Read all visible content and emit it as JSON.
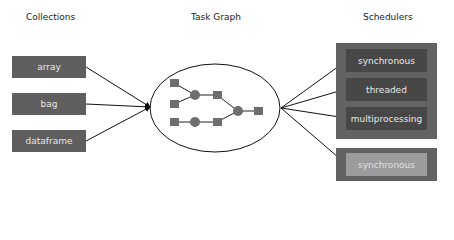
{
  "titles": {
    "collections": "Collections",
    "task_graph": "Task Graph",
    "schedulers": "Schedulers"
  },
  "collections": [
    {
      "label": "array"
    },
    {
      "label": "bag"
    },
    {
      "label": "dataframe"
    }
  ],
  "schedulers": {
    "group_main": [
      {
        "label": "synchronous"
      },
      {
        "label": "threaded"
      },
      {
        "label": "multiprocessing"
      }
    ],
    "group_secondary": [
      {
        "label": "synchronous"
      }
    ]
  },
  "task_graph": {
    "nodes": [
      {
        "type": "task",
        "shape": "square",
        "x": 174,
        "y": 83
      },
      {
        "type": "task",
        "shape": "square",
        "x": 174,
        "y": 104
      },
      {
        "type": "task",
        "shape": "square",
        "x": 174,
        "y": 122
      },
      {
        "type": "data",
        "shape": "circle",
        "x": 195,
        "y": 95
      },
      {
        "type": "data",
        "shape": "circle",
        "x": 195,
        "y": 122
      },
      {
        "type": "task",
        "shape": "square",
        "x": 217,
        "y": 95
      },
      {
        "type": "task",
        "shape": "square",
        "x": 217,
        "y": 122
      },
      {
        "type": "data",
        "shape": "circle",
        "x": 238,
        "y": 111
      },
      {
        "type": "task",
        "shape": "square",
        "x": 258,
        "y": 111
      }
    ]
  },
  "colors": {
    "collection_box": "#5f5f5f",
    "scheduler_outer": "#626262",
    "scheduler_inner": "#474747",
    "scheduler_inner_light": "#9c9c9c",
    "node": "#6e6e6e",
    "line": "#111111"
  }
}
